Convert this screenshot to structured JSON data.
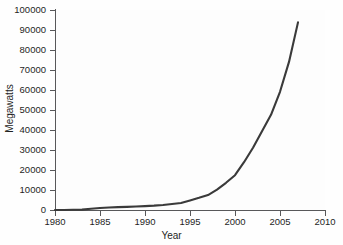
{
  "chart_data": {
    "type": "line",
    "title": "",
    "xlabel": "Year",
    "ylabel": "Megawatts",
    "xlim": [
      1980,
      2010
    ],
    "ylim": [
      0,
      100000
    ],
    "grid": false,
    "legend": null,
    "line_color": "#3a3a3a",
    "x": [
      1980,
      1981,
      1982,
      1983,
      1984,
      1985,
      1986,
      1987,
      1988,
      1989,
      1990,
      1991,
      1992,
      1993,
      1994,
      1995,
      1996,
      1997,
      1998,
      1999,
      2000,
      2001,
      2002,
      2003,
      2004,
      2005,
      2006,
      2007
    ],
    "values": [
      10,
      25,
      90,
      210,
      600,
      1020,
      1270,
      1450,
      1580,
      1730,
      1930,
      2170,
      2510,
      2990,
      3490,
      4780,
      6070,
      7480,
      10150,
      13600,
      17400,
      23900,
      31100,
      39431,
      47620,
      59091,
      74052,
      93820
    ],
    "series": [
      {
        "name": "Global installed wind power capacity",
        "values": [
          10,
          25,
          90,
          210,
          600,
          1020,
          1270,
          1450,
          1580,
          1730,
          1930,
          2170,
          2510,
          2990,
          3490,
          4780,
          6070,
          7480,
          10150,
          13600,
          17400,
          23900,
          31100,
          39431,
          47620,
          59091,
          74052,
          93820
        ]
      }
    ],
    "x_ticks": [
      1980,
      1985,
      1990,
      1995,
      2000,
      2005,
      2010
    ],
    "x_tick_labels": [
      "1980",
      "1985",
      "1990",
      "1995",
      "2000",
      "2005",
      "2010"
    ],
    "y_ticks": [
      0,
      10000,
      20000,
      30000,
      40000,
      50000,
      60000,
      70000,
      80000,
      90000,
      100000
    ],
    "y_tick_labels": [
      "0",
      "10000",
      "20000",
      "30000",
      "40000",
      "50000",
      "60000",
      "70000",
      "80000",
      "90000",
      "100000"
    ]
  }
}
